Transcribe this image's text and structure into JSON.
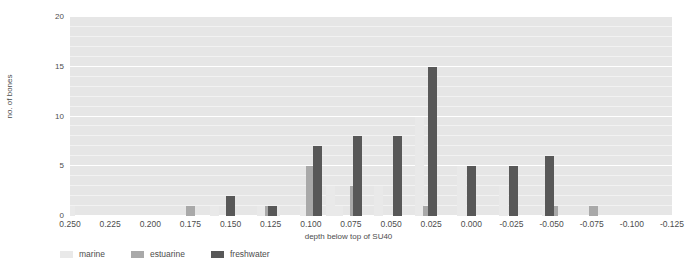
{
  "chart_data": {
    "type": "bar",
    "title": "",
    "xlabel": "depth below top of SU40",
    "ylabel": "no. of bones",
    "ylim": [
      0,
      20
    ],
    "yticks": [
      0,
      5,
      10,
      15,
      20
    ],
    "xticks": [
      "0.250",
      "0.225",
      "0.200",
      "0.175",
      "0.150",
      "0.125",
      "0.100",
      "0.075",
      "0.050",
      "0.025",
      "0.000",
      "-0.025",
      "-0.050",
      "-0.075",
      "-0.100",
      "-0.125"
    ],
    "xtick_values": [
      0.25,
      0.225,
      0.2,
      0.175,
      0.15,
      0.125,
      0.1,
      0.075,
      0.05,
      0.025,
      0.0,
      -0.025,
      -0.05,
      -0.075,
      -0.1,
      -0.125
    ],
    "x_axis_direction": "decreasing",
    "grid": true,
    "grid_interval": 1,
    "grid_major_interval": 5,
    "legend_position": "below",
    "series": [
      {
        "name": "marine",
        "color": "#e9e9e9",
        "points": [
          {
            "x": 0.25,
            "y": 1
          },
          {
            "x": 0.16,
            "y": 1
          },
          {
            "x": 0.131,
            "y": 1
          },
          {
            "x": 0.122,
            "y": 1
          },
          {
            "x": 0.104,
            "y": 1
          },
          {
            "x": 0.088,
            "y": 3
          },
          {
            "x": 0.083,
            "y": 1
          },
          {
            "x": 0.058,
            "y": 3
          },
          {
            "x": 0.032,
            "y": 10
          },
          {
            "x": 0.006,
            "y": 5
          },
          {
            "x": 0.002,
            "y": 1
          },
          {
            "x": -0.02,
            "y": 3
          },
          {
            "x": -0.047,
            "y": 1
          }
        ]
      },
      {
        "name": "estuarine",
        "color": "#a9a9a9",
        "points": [
          {
            "x": 0.175,
            "y": 1
          },
          {
            "x": 0.126,
            "y": 1
          },
          {
            "x": 0.1,
            "y": 5
          },
          {
            "x": 0.073,
            "y": 3
          },
          {
            "x": 0.027,
            "y": 1
          },
          {
            "x": -0.051,
            "y": 1
          },
          {
            "x": -0.076,
            "y": 1
          }
        ]
      },
      {
        "name": "freshwater",
        "color": "#585858",
        "points": [
          {
            "x": 0.15,
            "y": 2
          },
          {
            "x": 0.124,
            "y": 1
          },
          {
            "x": 0.096,
            "y": 7
          },
          {
            "x": 0.071,
            "y": 8
          },
          {
            "x": 0.046,
            "y": 8
          },
          {
            "x": 0.024,
            "y": 15
          },
          {
            "x": 0.0,
            "y": 5
          },
          {
            "x": -0.026,
            "y": 5
          },
          {
            "x": -0.049,
            "y": 6
          }
        ]
      }
    ]
  },
  "legend": {
    "items": [
      {
        "label": "marine",
        "color": "#e9e9e9"
      },
      {
        "label": "estuarine",
        "color": "#a9a9a9"
      },
      {
        "label": "freshwater",
        "color": "#585858"
      }
    ]
  },
  "colors": {
    "plot_background": "#e6e6e6",
    "gridline_minor": "#f2f2f2",
    "gridline_major": "#ffffff",
    "page_background": "#ffffff",
    "text": "#4d4d4d"
  }
}
